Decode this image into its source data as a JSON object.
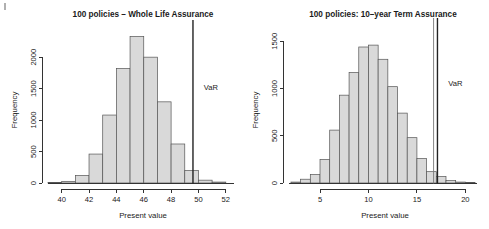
{
  "figure": {
    "page_marker": "",
    "panels": [
      "left",
      "right"
    ]
  },
  "chart_data": [
    {
      "id": "whole-life-assurance",
      "type": "bar",
      "title": "100 policies – Whole Life Assurance",
      "xlabel": "Present value",
      "ylabel": "Frequency",
      "xlim": [
        39.0,
        52.6
      ],
      "ylim": [
        0,
        2400
      ],
      "xticks": [
        40,
        42,
        44,
        46,
        48,
        50,
        52
      ],
      "yticks": [
        0,
        500,
        1000,
        1500,
        2000
      ],
      "grid": false,
      "legend": "none",
      "bin_width": 1,
      "bin_starts": [
        39,
        40,
        41,
        42,
        43,
        44,
        45,
        46,
        47,
        48,
        49,
        50,
        51
      ],
      "categories": [
        "39-40",
        "40-41",
        "41-42",
        "42-43",
        "43-44",
        "44-45",
        "45-46",
        "46-47",
        "47-48",
        "48-49",
        "49-50",
        "50-51",
        "51-52"
      ],
      "values": [
        8,
        25,
        120,
        460,
        1080,
        1820,
        2330,
        2000,
        1290,
        620,
        200,
        45,
        15
      ],
      "annotations": [
        {
          "label": "VaR",
          "type": "vline",
          "x": 49.6,
          "style": "solid-dark",
          "label_y": 1480
        }
      ]
    },
    {
      "id": "ten-year-term-assurance",
      "type": "bar",
      "title": "100 policies: 10–year Term Assurance",
      "xlabel": "Present value",
      "ylabel": "Frequency",
      "xlim": [
        1.8,
        21.2
      ],
      "ylim": [
        0,
        1620
      ],
      "xticks": [
        5,
        10,
        15,
        20
      ],
      "yticks": [
        0,
        500,
        1000,
        1500
      ],
      "grid": false,
      "legend": "none",
      "bin_width": 1,
      "bin_starts": [
        2,
        3,
        4,
        5,
        6,
        7,
        8,
        9,
        10,
        11,
        12,
        13,
        14,
        15,
        16,
        17,
        18,
        19,
        20
      ],
      "categories": [
        "2-3",
        "3-4",
        "4-5",
        "5-6",
        "6-7",
        "7-8",
        "8-9",
        "9-10",
        "10-11",
        "11-12",
        "12-13",
        "13-14",
        "14-15",
        "15-16",
        "16-17",
        "17-18",
        "18-19",
        "19-20",
        "20-21"
      ],
      "values": [
        10,
        40,
        90,
        250,
        560,
        930,
        1170,
        1440,
        1460,
        1310,
        1020,
        740,
        480,
        260,
        120,
        70,
        25,
        10,
        5
      ],
      "annotations": [
        {
          "label": "",
          "type": "vline",
          "x": 16.72,
          "style": "solid-thin",
          "label_y": 0
        },
        {
          "label": "VaR",
          "type": "vline",
          "x": 17.12,
          "style": "solid-dark",
          "label_y": 1030
        }
      ]
    }
  ]
}
